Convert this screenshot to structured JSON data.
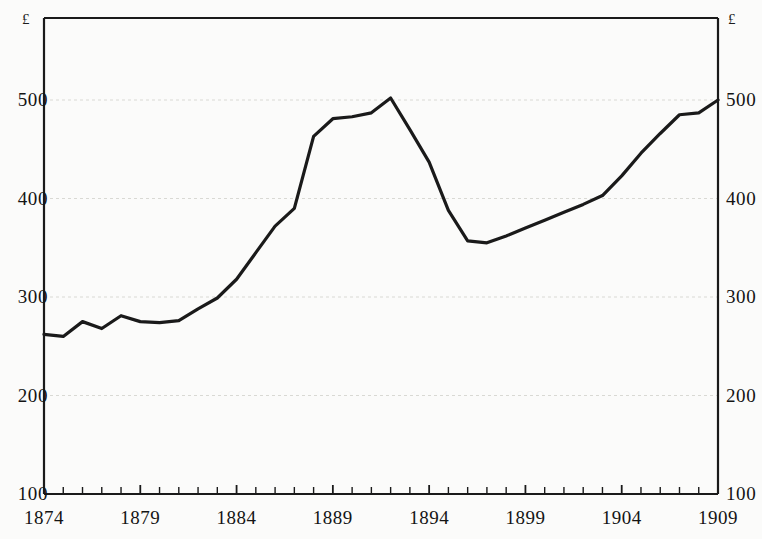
{
  "chart_data": {
    "type": "line",
    "title": "",
    "subtitle": "",
    "xlabel": "",
    "ylabel": "",
    "unit_label_left": "£",
    "unit_label_right": "£",
    "xlim": [
      1874,
      1909
    ],
    "ylim": [
      100,
      500
    ],
    "grid": true,
    "grid_axis": "y",
    "legend": null,
    "legend_position": "none",
    "y_ticks": [
      100,
      200,
      300,
      400,
      500
    ],
    "y_tick_labels": [
      "100",
      "200",
      "300",
      "400",
      "500"
    ],
    "y_axis_right_mirrored": true,
    "x_ticks_labeled": [
      1874,
      1879,
      1884,
      1889,
      1894,
      1899,
      1904,
      1909
    ],
    "x_tick_labels": [
      "1874",
      "1879",
      "1884",
      "1889",
      "1894",
      "1899",
      "1904",
      "1909"
    ],
    "x_minor_tick_interval": 1,
    "series": [
      {
        "name": "value",
        "color": "#1a1a1a",
        "x": [
          1874,
          1875,
          1876,
          1877,
          1878,
          1879,
          1880,
          1881,
          1882,
          1883,
          1884,
          1885,
          1886,
          1887,
          1888,
          1889,
          1890,
          1891,
          1892,
          1893,
          1894,
          1895,
          1896,
          1897,
          1898,
          1899,
          1900,
          1901,
          1902,
          1903,
          1904,
          1905,
          1906,
          1907,
          1908,
          1909
        ],
        "values": [
          262,
          260,
          275,
          268,
          281,
          275,
          274,
          276,
          288,
          299,
          318,
          345,
          372,
          390,
          463,
          481,
          483,
          487,
          502,
          470,
          437,
          388,
          357,
          355,
          362,
          370,
          378,
          386,
          394,
          403,
          423,
          446,
          466,
          485,
          487,
          500
        ]
      }
    ]
  }
}
